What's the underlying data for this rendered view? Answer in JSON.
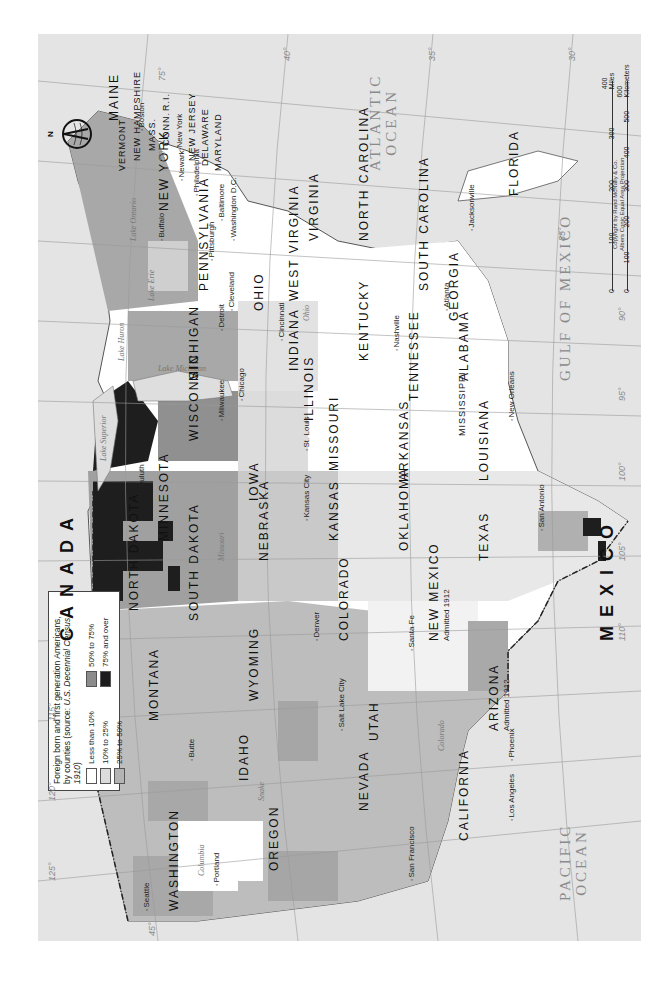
{
  "map": {
    "subject": "Foreign born and first generation Americans",
    "orientation": "rotated 90 degrees counter-clockwise",
    "legend": {
      "title_line1": "Foreign born and first generation Americans,",
      "title_line2_prefix": "by counties (source: ",
      "title_line2_source": "U.S. Decennial Census, 1910",
      "title_line2_suffix": ")",
      "items": [
        {
          "label": "Less than 10%",
          "color": "#ffffff"
        },
        {
          "label": "50% to 75%",
          "color": "#8c8c8c"
        },
        {
          "label": "10% to 25%",
          "color": "#dcdcdc"
        },
        {
          "label": "75% and over",
          "color": "#1c1c1c"
        },
        {
          "label": "25% to 50%",
          "color": "#b4b4b4"
        }
      ]
    },
    "countries": {
      "canada": "CANADA",
      "mexico": "MEXICO"
    },
    "oceans": {
      "atlantic_1": "ATLANTIC",
      "atlantic_2": "OCEAN",
      "pacific_1": "PACIFIC",
      "pacific_2": "OCEAN",
      "gulf": "GULF OF MEXICO"
    },
    "lakes": {
      "superior": "Lake Superior",
      "michigan": "Lake Michigan",
      "huron": "Lake Huron",
      "erie": "Lake Erie",
      "ontario": "Lake Ontario"
    },
    "states": {
      "maine": "MAINE",
      "vermont": "VERMONT",
      "new_hampshire": "NEW HAMPSHIRE",
      "mass": "MASS.",
      "conn": "CONN.",
      "ri": "R.I.",
      "new_york": "NEW YORK",
      "new_jersey": "NEW JERSEY",
      "delaware": "DELAWARE",
      "maryland": "MARYLAND",
      "pennsylvania": "PENNSYLVANIA",
      "ohio": "OHIO",
      "west_virginia": "WEST VIRGINIA",
      "virginia": "VIRGINIA",
      "north_carolina": "NORTH CAROLINA",
      "south_carolina": "SOUTH CAROLINA",
      "georgia": "GEORGIA",
      "florida": "FLORIDA",
      "alabama": "ALABAMA",
      "mississippi": "MISSISSIPPI",
      "tennessee": "TENNESSEE",
      "kentucky": "KENTUCKY",
      "indiana": "INDIANA",
      "illinois": "ILLINOIS",
      "michigan": "MICHIGAN",
      "wisconsin": "WISCONSIN",
      "minnesota": "MINNESOTA",
      "iowa": "IOWA",
      "missouri": "MISSOURI",
      "arkansas": "ARKANSAS",
      "louisiana": "LOUISIANA",
      "texas": "TEXAS",
      "oklahoma": "OKLAHOMA",
      "kansas": "KANSAS",
      "nebraska": "NEBRASKA",
      "south_dakota": "SOUTH DAKOTA",
      "north_dakota": "NORTH DAKOTA",
      "montana": "MONTANA",
      "wyoming": "WYOMING",
      "colorado": "COLORADO",
      "new_mexico": "NEW MEXICO",
      "arizona": "ARIZONA",
      "utah": "UTAH",
      "idaho": "IDAHO",
      "nevada": "NEVADA",
      "california": "CALIFORNIA",
      "oregon": "OREGON",
      "washington": "WASHINGTON"
    },
    "admitted": {
      "new_mexico": "Admitted 1912",
      "arizona": "Admitted 1912"
    },
    "cities": {
      "boston": "Boston",
      "new_york": "New York",
      "newark": "Newark",
      "philadelphia": "Philadelphia",
      "baltimore": "Baltimore",
      "washington_dc": "Washington D.C.",
      "pittsburgh": "Pittsburgh",
      "buffalo": "Buffalo",
      "cleveland": "Cleveland",
      "detroit": "Detroit",
      "cincinnati": "Cincinnati",
      "chicago": "Chicago",
      "milwaukee": "Milwaukee",
      "duluth": "Duluth",
      "st_louis": "St. Louis",
      "kansas_city": "Kansas City",
      "nashville": "Nashville",
      "atlanta": "Atlanta",
      "jacksonville": "Jacksonville",
      "new_orleans": "New Orleans",
      "san_antonio": "San Antonio",
      "santa_fe": "Santa Fe",
      "denver": "Denver",
      "salt_lake_city": "Salt Lake City",
      "phoenix": "Phoenix",
      "butte": "Butte",
      "seattle": "Seattle",
      "portland": "Portland",
      "san_francisco": "San Francisco",
      "los_angeles": "Los Angeles"
    },
    "rivers": {
      "ohio": "Ohio",
      "columbia": "Columbia",
      "snake": "Snake",
      "colorado": "Colorado",
      "missouri": "Missouri"
    },
    "graticule": {
      "longitudes": [
        "75°",
        "80°",
        "85°",
        "90°",
        "95°",
        "100°",
        "105°",
        "110°",
        "115°",
        "120°",
        "125°"
      ],
      "latitudes": [
        "30°",
        "35°",
        "40°",
        "45°"
      ]
    },
    "scale": {
      "miles_ticks": [
        "0",
        "100",
        "200",
        "300",
        "400 Miles"
      ],
      "km_ticks": [
        "0",
        "100",
        "200",
        "300",
        "400",
        "500",
        "600 Kilometers"
      ]
    },
    "copyright_1": "Copyright by Rand McNally & Co.",
    "copyright_2": "Albers Conic Equal Area Projection",
    "compass_label": "N"
  }
}
